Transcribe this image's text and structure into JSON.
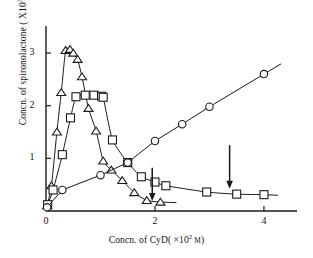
{
  "figure": {
    "background": "#ffffff",
    "ink_color": "#1a1a1a"
  },
  "labels": {
    "y_axis_prefix": "Concn. of spironolactone ( X10",
    "y_axis_exponent": "3",
    "y_axis_suffix_unit": "M",
    "y_axis_close": ")",
    "x_axis_prefix": "Concn. of CyD( ×10",
    "x_axis_exponent": "2",
    "x_axis_suffix_unit": "M",
    "x_axis_close": ")",
    "y_axis_full": "Concn. of spironolactone ( X10³ M)",
    "x_axis_full": "Concn. of CyD( ×10² M)"
  },
  "ticks": {
    "x": [
      {
        "value": 0,
        "label": "0"
      },
      {
        "value": 2,
        "label": "2"
      },
      {
        "value": 4,
        "label": "4"
      }
    ],
    "y": [
      {
        "value": 1,
        "label": "1"
      },
      {
        "value": 2,
        "label": "2"
      },
      {
        "value": 3,
        "label": "3"
      }
    ]
  },
  "chart_data": {
    "type": "line",
    "title": "",
    "xlabel": "Concn. of CyD( ×10² M)",
    "ylabel": "Concn. of spironolactone ( X10³ M)",
    "xlim": [
      0,
      4.35
    ],
    "ylim": [
      0,
      3.4
    ],
    "xticks": [
      0,
      2,
      4
    ],
    "yticks": [
      1,
      2,
      3
    ],
    "grid": false,
    "legend_position": "none",
    "series": [
      {
        "name": "triangle-series",
        "marker": "open-triangle-up",
        "x": [
          0.02,
          0.1,
          0.2,
          0.28,
          0.36,
          0.44,
          0.5,
          0.58,
          0.66,
          0.78,
          0.92,
          1.05,
          1.2,
          1.4,
          1.62,
          1.85,
          2.1
        ],
        "y": [
          0.1,
          0.48,
          1.5,
          2.25,
          3.05,
          3.07,
          3.0,
          2.88,
          2.55,
          1.95,
          1.52,
          0.95,
          0.78,
          0.58,
          0.35,
          0.2,
          0.17
        ]
      },
      {
        "name": "square-series",
        "marker": "open-square",
        "x": [
          0.03,
          0.13,
          0.3,
          0.45,
          0.55,
          0.72,
          0.88,
          1.02,
          1.05,
          1.22,
          1.5,
          1.75,
          2.0,
          2.2,
          2.95,
          3.5,
          4.0
        ],
        "y": [
          0.12,
          0.4,
          1.07,
          1.77,
          2.17,
          2.2,
          2.2,
          2.18,
          2.16,
          1.35,
          0.92,
          0.65,
          0.55,
          0.48,
          0.36,
          0.32,
          0.31
        ]
      },
      {
        "name": "circle-series",
        "marker": "open-circle",
        "x": [
          0.02,
          0.3,
          1.0,
          1.5,
          2.0,
          2.5,
          3.0,
          4.0
        ],
        "y": [
          0.07,
          0.4,
          0.68,
          0.92,
          1.33,
          1.65,
          1.98,
          2.6
        ]
      }
    ],
    "annotations": [
      {
        "name": "arrow-triangle-endpoint",
        "type": "down-arrow",
        "x": 1.95,
        "y_tip": 0.22,
        "y_tail": 0.82
      },
      {
        "name": "arrow-square-endpoint",
        "type": "down-arrow",
        "x": 3.37,
        "y_tip": 0.45,
        "y_tail": 1.25
      }
    ]
  }
}
